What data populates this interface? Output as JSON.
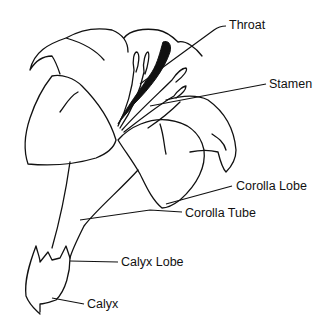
{
  "diagram": {
    "stroke_color": "#111111",
    "background_color": "#ffffff",
    "labels": [
      {
        "id": "throat",
        "text": "Throat",
        "x": 229,
        "y": 19
      },
      {
        "id": "stamen",
        "text": "Stamen",
        "x": 269,
        "y": 78
      },
      {
        "id": "corolla-lobe",
        "text": "Corolla Lobe",
        "x": 236,
        "y": 180
      },
      {
        "id": "corolla-tube",
        "text": "Corolla Tube",
        "x": 185,
        "y": 207
      },
      {
        "id": "calyx-lobe",
        "text": "Calyx Lobe",
        "x": 121,
        "y": 256
      },
      {
        "id": "calyx",
        "text": "Calyx",
        "x": 87,
        "y": 298
      }
    ]
  }
}
